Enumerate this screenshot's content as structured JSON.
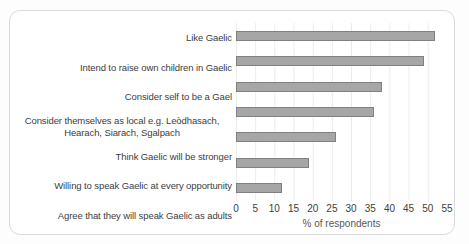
{
  "chart": {
    "frame": "rounded-border-card",
    "colors": {
      "bar_fill": "#a6a6a6",
      "bar_border": "#808080",
      "gridline": "#ebebeb",
      "label_text": "#404040",
      "axis_text": "#595959",
      "frame_border": "#d9d9d9",
      "background": "#ffffff"
    }
  },
  "chart_data": {
    "type": "bar",
    "orientation": "horizontal",
    "title": "",
    "xlabel": "% of respondents",
    "ylabel": "",
    "categories": [
      "Like Gaelic",
      "Intend to raise own children in Gaelic",
      "Consider self to be a Gael",
      "Consider themselves as local e.g. Leòdhasach, Hearach, Siarach, Sgalpach",
      "Think Gaelic will be stronger",
      "Willing to speak Gaelic at every opportunity",
      "Agree that they will speak Gaelic as adults"
    ],
    "values": [
      52,
      49,
      38,
      36,
      26,
      19,
      12
    ],
    "xlim": [
      0,
      55
    ],
    "x_ticks": [
      0,
      5,
      10,
      15,
      20,
      25,
      30,
      35,
      40,
      45,
      50,
      55
    ],
    "grid": true,
    "legend": false
  }
}
